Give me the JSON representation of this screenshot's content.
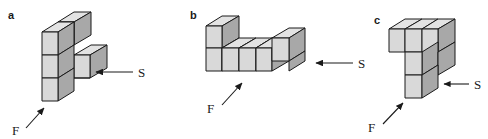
{
  "figure": {
    "type": "isometric-cube-diagram",
    "background_color": "#ffffff",
    "face_colors": {
      "front": "#d9d9d9",
      "top": "#e3e3e3",
      "side": "#a8a8a8",
      "edge": "#1a1a1a"
    },
    "panels": [
      {
        "id": "a",
        "label": "a",
        "cube_count": 5,
        "annotations": [
          {
            "name": "front-arrow",
            "label": "F",
            "direction": "up-right"
          },
          {
            "name": "side-arrow",
            "label": "S",
            "direction": "left"
          }
        ]
      },
      {
        "id": "b",
        "label": "b",
        "cube_count": 6,
        "annotations": [
          {
            "name": "front-arrow",
            "label": "F",
            "direction": "up-right"
          },
          {
            "name": "side-arrow",
            "label": "S",
            "direction": "left"
          }
        ]
      },
      {
        "id": "c",
        "label": "c",
        "cube_count": 6,
        "annotations": [
          {
            "name": "front-arrow",
            "label": "F",
            "direction": "up-right"
          },
          {
            "name": "side-arrow",
            "label": "S",
            "direction": "left"
          }
        ]
      }
    ]
  },
  "labels": {
    "panel_a": "a",
    "panel_b": "b",
    "panel_c": "c",
    "front_a": "F",
    "side_a": "S",
    "front_b": "F",
    "side_b": "S",
    "front_c": "F",
    "side_c": "S"
  }
}
